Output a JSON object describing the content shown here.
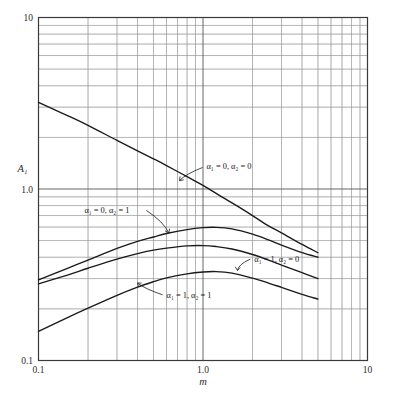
{
  "chart_data": {
    "type": "line",
    "title": "",
    "xlabel": "m",
    "ylabel": "A₁",
    "xscale": "log",
    "yscale": "log",
    "xlim": [
      0.1,
      10
    ],
    "ylim": [
      0.1,
      10
    ],
    "grid": true,
    "grid_style": "log minor gridlines both axes",
    "legend": "inline curve annotations",
    "xticks": [
      "0.1",
      "1.0",
      "10"
    ],
    "xtick_values": [
      0.1,
      1.0,
      10
    ],
    "yticks": [
      "0.1",
      "1.0",
      "10"
    ],
    "ytick_values": [
      0.1,
      1.0,
      10
    ],
    "series": [
      {
        "name": "α₁ = 0, α₂ = 0",
        "label": "α₁ = 0, α₂ = 0",
        "label_x": 1.05,
        "label_y": 1.3,
        "leader_to_x": 0.72,
        "leader_to_y": 1.12,
        "x": [
          0.1,
          0.15,
          0.2,
          0.3,
          0.4,
          0.5,
          0.6,
          0.8,
          1.0,
          1.3,
          1.6,
          2.0,
          2.5,
          3.0,
          4.0,
          5.0
        ],
        "y": [
          3.2,
          2.68,
          2.35,
          1.92,
          1.67,
          1.5,
          1.37,
          1.18,
          1.05,
          0.9,
          0.8,
          0.7,
          0.61,
          0.555,
          0.475,
          0.425
        ]
      },
      {
        "name": "α₁ = 0, α₂ = 1",
        "label": "α₁ = 0, α₂ = 1",
        "label_x": 0.19,
        "label_y": 0.72,
        "leader_to_x": 0.62,
        "leader_to_y": 0.555,
        "x": [
          0.1,
          0.15,
          0.2,
          0.3,
          0.4,
          0.5,
          0.6,
          0.8,
          1.0,
          1.2,
          1.5,
          2.0,
          2.5,
          3.0,
          4.0,
          5.0
        ],
        "y": [
          0.295,
          0.345,
          0.385,
          0.45,
          0.495,
          0.525,
          0.55,
          0.58,
          0.595,
          0.598,
          0.585,
          0.545,
          0.505,
          0.47,
          0.425,
          0.4
        ]
      },
      {
        "name": "α₁ = 1, α₂ = 0",
        "label": "α₁ = 1, α₂ = 0",
        "label_x": 2.05,
        "label_y": 0.375,
        "leader_to_x": 1.62,
        "leader_to_y": 0.335,
        "x": [
          0.1,
          0.15,
          0.2,
          0.3,
          0.4,
          0.5,
          0.6,
          0.8,
          1.0,
          1.2,
          1.5,
          2.0,
          2.5,
          3.0,
          4.0,
          5.0
        ],
        "y": [
          0.28,
          0.315,
          0.345,
          0.39,
          0.42,
          0.44,
          0.452,
          0.466,
          0.468,
          0.462,
          0.447,
          0.415,
          0.385,
          0.36,
          0.325,
          0.3
        ]
      },
      {
        "name": "α₁ = 1, α₂ = 1",
        "label": "α₁ = 1, α₂ = 1",
        "label_x": 0.6,
        "label_y": 0.232,
        "leader_to_x": 0.4,
        "leader_to_y": 0.283,
        "x": [
          0.1,
          0.15,
          0.2,
          0.3,
          0.4,
          0.5,
          0.6,
          0.8,
          1.0,
          1.2,
          1.5,
          2.0,
          2.5,
          3.0,
          4.0,
          5.0
        ],
        "y": [
          0.148,
          0.178,
          0.202,
          0.24,
          0.268,
          0.288,
          0.303,
          0.32,
          0.328,
          0.33,
          0.323,
          0.302,
          0.283,
          0.267,
          0.243,
          0.228
        ]
      }
    ]
  },
  "axes": {
    "y_axis_title": "A₁",
    "x_axis_title": "m",
    "y_tick_top": "10",
    "y_tick_mid": "1.0",
    "y_tick_bottom": "0.1",
    "x_tick_left": "0.1",
    "x_tick_mid": "1.0",
    "x_tick_right": "10"
  },
  "colors": {
    "curve": "#1a1a1a",
    "axis": "#3a3a3a",
    "major_grid": "#8a8a8a",
    "minor_grid": "#c9c9c9",
    "text": "#2b2b2b",
    "caption": "#bdbdbd",
    "background": "#ffffff"
  },
  "caption": {
    "text": ""
  }
}
